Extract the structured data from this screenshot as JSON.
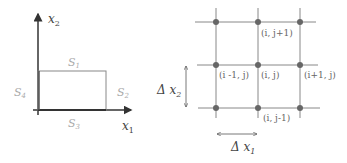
{
  "left_panel": {
    "y_axis_label": "x",
    "y_axis_sub": "2",
    "x_axis_label": "x",
    "x_axis_sub": "1",
    "sides": {
      "top": {
        "label": "S",
        "sub": "1"
      },
      "right": {
        "label": "S",
        "sub": "2"
      },
      "bottom": {
        "label": "S",
        "sub": "3"
      },
      "left": {
        "label": "S",
        "sub": "4"
      }
    }
  },
  "right_panel": {
    "nodes": {
      "top_mid": "(i, j+1)",
      "mid_left": "(i -1, j)",
      "center": "(i, j)",
      "mid_right": "(i+1, j)",
      "bottom_mid": "(i, j-1)"
    },
    "dx2_label": "Δ x",
    "dx2_sub": "2",
    "dx1_label": "Δ x",
    "dx1_sub": "1"
  },
  "colors": {
    "axis": "#333333",
    "rect": "#777777",
    "grid": "#888888",
    "node": "#666666"
  }
}
